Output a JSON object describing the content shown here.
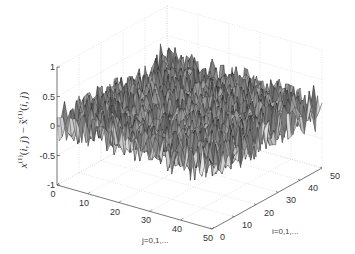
{
  "chart_data": {
    "type": "surface3d",
    "title": "",
    "xlabel": "j=0,1,...",
    "ylabel": "i=0,1,...",
    "zlabel": "x^(1)(i,j) − x̃^(1)(i,j)",
    "x_ticks": [
      0,
      10,
      20,
      30,
      40,
      50
    ],
    "y_ticks": [
      0,
      10,
      20,
      30,
      40,
      50
    ],
    "z_ticks": [
      -1,
      -0.5,
      0,
      0.5,
      1
    ],
    "z_tick_labels": [
      "-1",
      "-0.5",
      "0",
      "0.5",
      "1"
    ],
    "xlim": [
      0,
      50
    ],
    "ylim": [
      0,
      50
    ],
    "zlim": [
      -1,
      1
    ],
    "grid": true,
    "grid_size": 50,
    "surface_description": "random noise error surface on 50x50 grid, values mostly within -0.5 to 0.6, centered near 0.05",
    "z_mean": 0.05,
    "z_amplitude": 0.25,
    "colormap": "gray",
    "edge_color": "#222222"
  },
  "labels": {
    "x_axis": "j=0,1,...",
    "y_axis": "i=0,1,..."
  }
}
